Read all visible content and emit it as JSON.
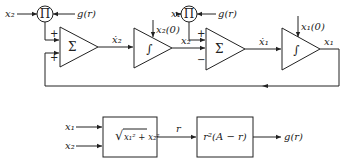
{
  "top_diagram": {
    "multiplier_1": {
      "symbol": "Π",
      "input_left": "x₂",
      "input_right": "g(r)"
    },
    "summer_1": {
      "symbol": "Σ",
      "sign_top": "+",
      "sign_bottom": "+"
    },
    "signal_x2dot_label": "ẋ₂",
    "integrator_1": {
      "symbol": "∫",
      "initial_condition": "x₂(0)"
    },
    "signal_x2_label": "x₂",
    "multiplier_2": {
      "symbol": "Π",
      "input_left": "x₁",
      "input_right": "g(r)"
    },
    "summer_2": {
      "symbol": "Σ",
      "sign_top": "+",
      "sign_bottom": "−"
    },
    "signal_x1dot_label": "ẋ₁",
    "integrator_2": {
      "symbol": "∫",
      "initial_condition": "x₁(0)"
    },
    "output_label": "x₁"
  },
  "bottom_diagram": {
    "input_1": "x₁",
    "input_2": "x₂",
    "block_1": {
      "formula_prefix": "√",
      "formula_body": "x₁² + x₂²"
    },
    "intermediate_label": "r",
    "block_2": {
      "formula": "r²(A − r)"
    },
    "output_label": "g(r)"
  }
}
